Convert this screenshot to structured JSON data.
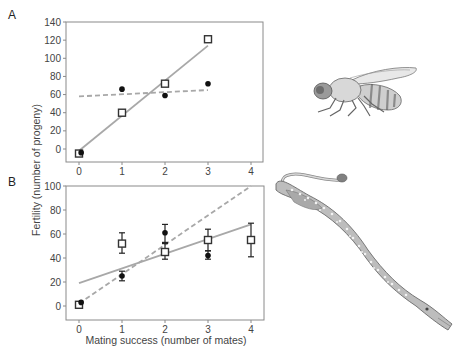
{
  "figure": {
    "panel_labels": [
      "A",
      "B"
    ],
    "ylabel": "Fertility (number of progeny)",
    "xlabel": "Mating success (number of mates)",
    "colors": {
      "axis": "#8a8a8a",
      "tick_text": "#444444",
      "square_series": "#333333",
      "dot_series": "#111111",
      "solid_line": "#a8a8a8",
      "dashed_line": "#a8a8a8"
    },
    "illustrations": [
      {
        "name": "fruit-fly-illustration",
        "panel": "A"
      },
      {
        "name": "pipefish-illustration",
        "panel": "B"
      }
    ]
  },
  "chart_data": [
    {
      "type": "scatter",
      "panel": "A",
      "title": "",
      "xlabel": "",
      "ylabel": "Fertility (number of progeny)",
      "xlim": [
        -0.3,
        4.3
      ],
      "ylim": [
        -15,
        140
      ],
      "xticks": [
        0,
        1,
        2,
        3,
        4
      ],
      "yticks": [
        0,
        20,
        40,
        60,
        80,
        100,
        120,
        140
      ],
      "grid": false,
      "series": [
        {
          "name": "open squares",
          "marker": "square",
          "x": [
            0,
            1,
            2,
            3
          ],
          "y": [
            -5,
            40,
            72,
            121
          ]
        },
        {
          "name": "filled circles",
          "marker": "circle",
          "x": [
            0.05,
            1,
            2,
            3
          ],
          "y": [
            -4,
            66,
            59,
            72
          ]
        }
      ],
      "fit_lines": [
        {
          "style": "solid",
          "for": "open squares",
          "x": [
            0,
            3
          ],
          "y": [
            -2,
            114
          ]
        },
        {
          "style": "dashed",
          "for": "filled circles",
          "x": [
            0,
            3
          ],
          "y": [
            58,
            65
          ]
        }
      ]
    },
    {
      "type": "scatter",
      "panel": "B",
      "title": "",
      "xlabel": "Mating success (number of mates)",
      "ylabel": "Fertility (number of progeny)",
      "xlim": [
        -0.3,
        4.3
      ],
      "ylim": [
        -11,
        100
      ],
      "xticks": [
        0,
        1,
        2,
        3,
        4
      ],
      "yticks": [
        0,
        20,
        40,
        60,
        80,
        100
      ],
      "grid": false,
      "series": [
        {
          "name": "open squares",
          "marker": "square",
          "x": [
            0,
            1,
            2,
            3,
            4
          ],
          "y": [
            1,
            52,
            45,
            55,
            55
          ],
          "err_low": [
            1,
            44,
            39,
            46,
            41
          ],
          "err_high": [
            1,
            61,
            52,
            64,
            69
          ]
        },
        {
          "name": "filled circles",
          "marker": "circle",
          "x": [
            0.05,
            1,
            2,
            3
          ],
          "y": [
            3,
            25,
            61,
            42
          ],
          "err_low": [
            3,
            21,
            53,
            39
          ],
          "err_high": [
            3,
            29,
            68,
            46
          ]
        }
      ],
      "fit_lines": [
        {
          "style": "solid",
          "for": "open squares",
          "x": [
            0,
            4
          ],
          "y": [
            19,
            68
          ]
        },
        {
          "style": "dashed",
          "for": "filled circles",
          "x": [
            0,
            4
          ],
          "y": [
            2,
            100
          ]
        }
      ]
    }
  ]
}
